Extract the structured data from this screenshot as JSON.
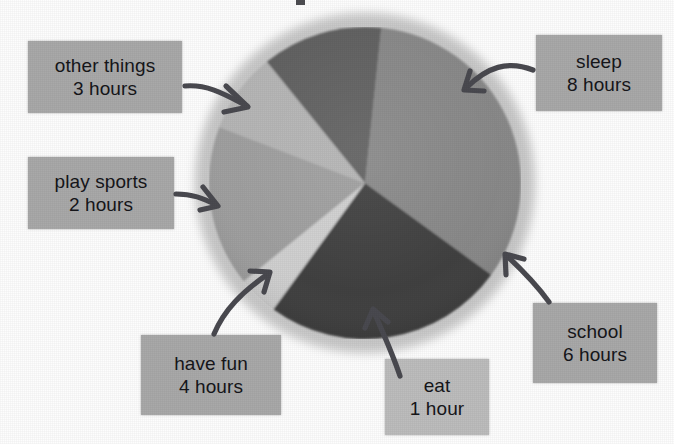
{
  "page": {
    "background_color": "#fdfdfd",
    "label_box_color": "#a9a9a9",
    "label_box_color_light": "#bdbdbd",
    "arrow_color": "#4a4a50"
  },
  "chart_data": {
    "type": "pie",
    "title": "",
    "xlabel": "",
    "ylabel": "",
    "total": 24,
    "units": "hours",
    "legend_position": "callout-labels",
    "grid": false,
    "categories": [
      "sleep",
      "school",
      "eat",
      "have fun",
      "play sports",
      "other things"
    ],
    "values": [
      8,
      6,
      1,
      4,
      2,
      3
    ],
    "slices": [
      {
        "name": "sleep",
        "label_line1": "sleep",
        "label_line2": "8 hours",
        "value": 8,
        "unit": "hours",
        "degrees": 120,
        "percent": 33.3,
        "color": "#878787",
        "start_angle": -84,
        "end_angle": 36
      },
      {
        "name": "school",
        "label_line1": "school",
        "label_line2": "6 hours",
        "value": 6,
        "unit": "hours",
        "degrees": 90,
        "percent": 25.0,
        "color": "#3d3d3d",
        "start_angle": 36,
        "end_angle": 126
      },
      {
        "name": "eat",
        "label_line1": "eat",
        "label_line2": "1 hour",
        "value": 1,
        "unit": "hour",
        "degrees": 15,
        "percent": 4.2,
        "color": "#cfcfcf",
        "start_angle": 126,
        "end_angle": 141
      },
      {
        "name": "have fun",
        "label_line1": "have fun",
        "label_line2": "4 hours",
        "value": 4,
        "unit": "hours",
        "degrees": 60,
        "percent": 16.7,
        "color": "#9e9e9e",
        "start_angle": 141,
        "end_angle": 201
      },
      {
        "name": "play sports",
        "label_line1": "play sports",
        "label_line2": "2 hours",
        "value": 2,
        "unit": "hours",
        "degrees": 30,
        "percent": 8.3,
        "color": "#b4b4b4",
        "start_angle": 201,
        "end_angle": 231
      },
      {
        "name": "other things",
        "label_line1": "other things",
        "label_line2": "3 hours",
        "value": 3,
        "unit": "hours",
        "degrees": 45,
        "percent": 12.5,
        "color": "#5e5e5e",
        "start_angle": 231,
        "end_angle": 276
      }
    ],
    "geometry": {
      "center_x": 365,
      "center_y": 183,
      "radius": 156
    }
  },
  "callouts": {
    "other_things": {
      "line1": "other things",
      "line2": "3 hours"
    },
    "play_sports": {
      "line1": "play sports",
      "line2": "2 hours"
    },
    "have_fun": {
      "line1": "have fun",
      "line2": "4 hours"
    },
    "eat": {
      "line1": "eat",
      "line2": "1 hour"
    },
    "school": {
      "line1": "school",
      "line2": "6 hours"
    },
    "sleep": {
      "line1": "sleep",
      "line2": "8 hours"
    }
  },
  "icons": {
    "arrow_other_things": "curved-arrow-icon",
    "arrow_play_sports": "curved-arrow-icon",
    "arrow_have_fun": "curved-arrow-icon",
    "arrow_eat": "curved-arrow-icon",
    "arrow_school": "curved-arrow-icon",
    "arrow_sleep": "curved-arrow-icon"
  }
}
